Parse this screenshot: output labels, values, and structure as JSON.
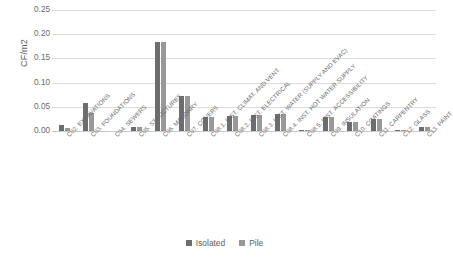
{
  "chart_data": {
    "type": "bar",
    "title": "",
    "xlabel": "",
    "ylabel": "CF/m2",
    "ylim": [
      0,
      0.25
    ],
    "ytick_labels": [
      "0.25",
      "0.20",
      "0.15",
      "0.10",
      "0.05",
      "0.00"
    ],
    "ytick_values": [
      0.25,
      0.2,
      0.15,
      0.1,
      0.05,
      0.0
    ],
    "grid": true,
    "legend_position": "bottom",
    "categories": [
      "C02. EXCAVATIONS",
      "C03. FOUNDATIONS",
      "C04. SEWERS",
      "C05. STRUCTURES",
      "C06. MASONRY",
      "C07. COVERS",
      "C08.1. INST. CLIMAT. AND VENT.",
      "C08.2. INST. ELECTRICAL",
      "C08.3. INST. WATER (SUPPLY AND EVAC)",
      "C08.4. INST. HOT WATER SUPPLY",
      "C08.5. INST. ACCESSIBILITY",
      "C09. INSULATION",
      "C10. COATINGS",
      "C11. CARPENTRY",
      "C12. GLASS",
      "C13. PAINT"
    ],
    "series": [
      {
        "name": "Isolated",
        "color": "#6d6d6d",
        "values": [
          0.012,
          0.057,
          0.0,
          0.009,
          0.183,
          0.073,
          0.029,
          0.03,
          0.033,
          0.035,
          0.002,
          0.029,
          0.019,
          0.024,
          0.001,
          0.008
        ]
      },
      {
        "name": "Pile",
        "color": "#989898",
        "values": [
          0.006,
          0.038,
          0.0,
          0.008,
          0.183,
          0.073,
          0.029,
          0.03,
          0.033,
          0.035,
          0.002,
          0.029,
          0.019,
          0.024,
          0.001,
          0.008
        ]
      }
    ]
  },
  "legend": {
    "items": [
      {
        "label": "Isolated",
        "key": "isolated"
      },
      {
        "label": "Pile",
        "key": "pile"
      }
    ]
  }
}
